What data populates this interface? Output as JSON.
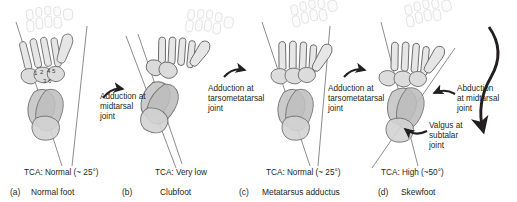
{
  "figure": {
    "kind": "foot-skeleton-comparison-diagram",
    "view": "dorsal radiographic tracing",
    "background": "#ffffff",
    "bone_fill_light": "#e9e9e9",
    "bone_fill_mid": "#d5d5d5",
    "bone_fill_dark": "#bdbdbd",
    "bone_outline_light": "#cfcfcf",
    "bone_outline_dark": "#58585a",
    "axis_line_color": "#6d6e71",
    "arrow_color": "#231f20"
  },
  "panels": [
    {
      "id": "a",
      "letter": "(a)",
      "name": "Normal foot",
      "tca": "TCA: Normal (~ 25°)",
      "bone_numbers": [
        "1",
        "2",
        "4",
        "5",
        "3",
        "6"
      ]
    },
    {
      "id": "b",
      "letter": "(b)",
      "name": "Clubfoot",
      "tca": "TCA: Very low",
      "bone_numbers": []
    },
    {
      "id": "c",
      "letter": "(c)",
      "name": "Metatarsus adductus",
      "tca": "TCA: Normal (~ 25°)",
      "bone_numbers": []
    },
    {
      "id": "d",
      "letter": "(d)",
      "name": "Skewfoot",
      "tca": "TCA: High (~50°)",
      "bone_numbers": []
    }
  ],
  "annotations": [
    {
      "id": "adduction-midtarsal",
      "text": "Adduction at\nmidtarsal\njoint"
    },
    {
      "id": "adduction-tarsometatarsal-c",
      "text": "Adduction at\ntarsometatarsal\njoint"
    },
    {
      "id": "adduction-tarsometatarsal-d",
      "text": "Adduction at\ntarsometatarsal\njoint"
    },
    {
      "id": "abduction-midtarsal",
      "text": "Abduction\nat midtarsal\njoint"
    },
    {
      "id": "valgus-subtalar",
      "text": "Valgus at\nsubtalar\njoint"
    }
  ]
}
